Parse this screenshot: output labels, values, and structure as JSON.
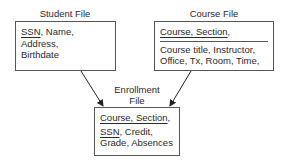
{
  "student_file": {
    "title": "Student File",
    "key": "SSN",
    "fields_line1_rest": ", Name, Address,",
    "fields_line2": "Birthdate"
  },
  "course_file": {
    "title": "Course File",
    "key": "Course, Section",
    "key_suffix": ",",
    "fields_line1": "Course title, Instructor,",
    "fields_line2": "Office, Tx, Room, Time,"
  },
  "enrollment_file": {
    "title_line1": "Enrollment",
    "title_line2": "File",
    "key1": "Course, Section",
    "key1_suffix": ",",
    "key2": "SSN",
    "line2_rest": ", Credit,",
    "line3": "Grade, Absences"
  },
  "relationships": [
    {
      "from": "Student File",
      "to": "Enrollment File"
    },
    {
      "from": "Course File",
      "to": "Enrollment File"
    }
  ]
}
